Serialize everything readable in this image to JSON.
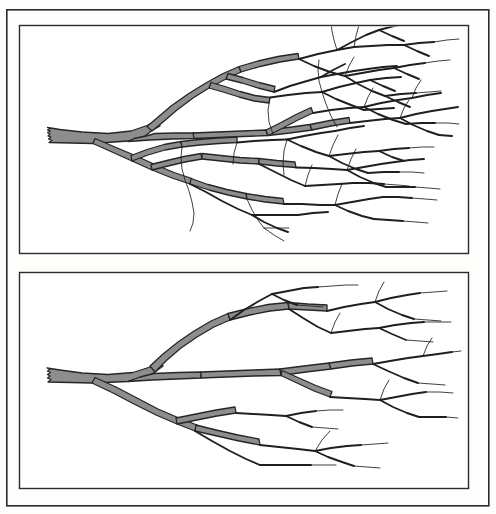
{
  "figure": {
    "kind": "scientific-line-drawing",
    "background_color": "#fdfdfc",
    "outer_frame": {
      "name": "outer-border",
      "x": 6,
      "y": 9,
      "width": 482,
      "height": 496,
      "stroke_color": "#2b2b2b"
    },
    "panels": [
      {
        "id": "panel-top",
        "label": "Upper panel - dense branching structure",
        "x": 19,
        "y": 25,
        "width": 449,
        "height": 228,
        "fill_color": "#ffffff",
        "stroke_color": "#2b2b2b",
        "structure": {
          "type": "dendrogram",
          "description": "Densely ramified branching structure, trunk entering from left, fanning rightward into numerous fine terminal twigs",
          "trunk_origin": {
            "x": 48,
            "y": 135
          },
          "branch_fill_color": "#8d8d8d",
          "branch_outline_color": "#262626",
          "terminal_twig_color": "#1f1f1f",
          "order_count": 7,
          "terminal_tip_count": 64,
          "relative_density": "high"
        }
      },
      {
        "id": "panel-bottom",
        "label": "Lower panel - sparse branching structure",
        "x": 19,
        "y": 272,
        "width": 449,
        "height": 216,
        "fill_color": "#ffffff",
        "stroke_color": "#2b2b2b",
        "structure": {
          "type": "dendrogram",
          "description": "Sparsely ramified branching structure, trunk entering from left, fewer terminal twigs with wider spacing",
          "trunk_origin": {
            "x": 48,
            "y": 377
          },
          "branch_fill_color": "#8d8d8d",
          "branch_outline_color": "#262626",
          "terminal_twig_color": "#1f1f1f",
          "order_count": 5,
          "terminal_tip_count": 26,
          "relative_density": "low"
        }
      }
    ]
  }
}
